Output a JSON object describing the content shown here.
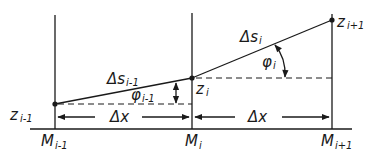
{
  "diagram": {
    "type": "geometric-discretization",
    "points": [
      {
        "id": "z_im1",
        "label": "z",
        "sub": "i-1"
      },
      {
        "id": "z_i",
        "label": "z",
        "sub": "i"
      },
      {
        "id": "z_ip1",
        "label": "z",
        "sub": "i+1"
      }
    ],
    "nodes": [
      {
        "label": "M",
        "sub": "i-1"
      },
      {
        "label": "M",
        "sub": "i"
      },
      {
        "label": "M",
        "sub": "i+1"
      }
    ],
    "segments": [
      {
        "label": "Δs",
        "sub": "i-1"
      },
      {
        "label": "Δs",
        "sub": "i"
      }
    ],
    "angles": [
      {
        "label": "φ",
        "sub": "i-1"
      },
      {
        "label": "φ",
        "sub": "i"
      }
    ],
    "spacing": [
      {
        "label": "Δx"
      },
      {
        "label": "Δx"
      }
    ],
    "colors": {
      "ink": "#1a1a1a",
      "background": "#ffffff"
    }
  }
}
